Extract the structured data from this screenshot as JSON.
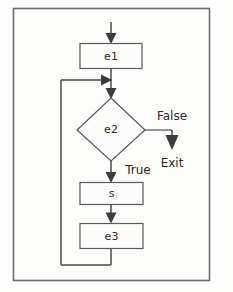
{
  "diagram": {
    "background_color": "#fdfdfc",
    "frame_color": "#6e6e6e",
    "line_color": "#4a4a4a",
    "node_fill": "#fcfcfb",
    "node_stroke": "#5a5a5a",
    "text_color": "#2c2c2c",
    "nodes": [
      {
        "id": "e1",
        "label": "e1",
        "shape": "rectangle"
      },
      {
        "id": "e2",
        "label": "e2",
        "shape": "diamond"
      },
      {
        "id": "s",
        "label": "s",
        "shape": "rectangle"
      },
      {
        "id": "e3",
        "label": "e3",
        "shape": "rectangle"
      }
    ],
    "edge_labels": [
      {
        "id": "false-label",
        "label": "False"
      },
      {
        "id": "exit-label",
        "label": "Exit"
      },
      {
        "id": "true-label",
        "label": "True"
      }
    ]
  }
}
